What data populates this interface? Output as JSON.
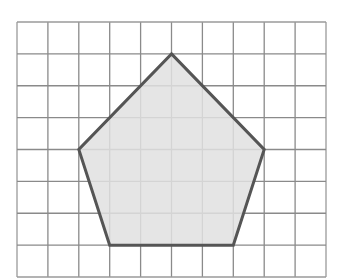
{
  "diagram": {
    "type": "pentagon-on-grid",
    "grid": {
      "cols": 10,
      "rows": 8,
      "x0": 17,
      "y0": 22,
      "x1": 326,
      "y1": 277,
      "line_color": "#8a8a8a",
      "border_color": "#9a9a9a"
    },
    "shape": {
      "name": "pentagon",
      "vertices_grid": [
        [
          5,
          1
        ],
        [
          8,
          4
        ],
        [
          7,
          7
        ],
        [
          3,
          7
        ],
        [
          2,
          4
        ]
      ],
      "fill": "#e0e0e0",
      "stroke": "#555555"
    }
  }
}
